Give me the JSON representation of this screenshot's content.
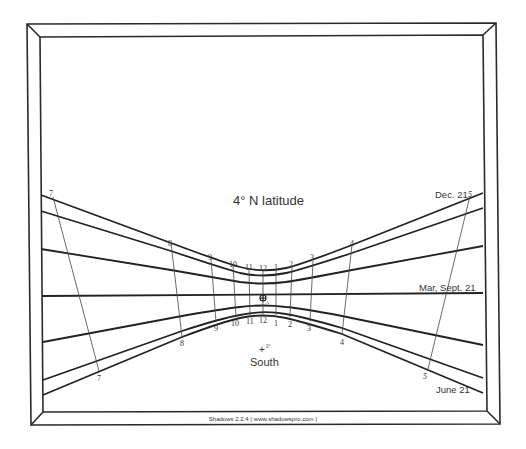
{
  "diagram": {
    "title": "4° N latitude",
    "direction_label": "South",
    "nodus_mark": "+",
    "nodus_superscript": "0°",
    "footer": "Shadows 2.2.4 ( www.shadowspro.com )",
    "date_lines": {
      "december": "Dec. 21",
      "equinox": "Mar, Sept. 21",
      "june": "June 21"
    },
    "hour_labels_top": [
      "7",
      "8",
      "9",
      "10",
      "11",
      "12",
      "1",
      "2",
      "3",
      "4",
      "5"
    ],
    "hour_labels_bottom": [
      "7",
      "8",
      "9",
      "10",
      "11",
      "12",
      "1",
      "2",
      "3",
      "4",
      "5"
    ],
    "gnomon_foot_label": "A"
  }
}
